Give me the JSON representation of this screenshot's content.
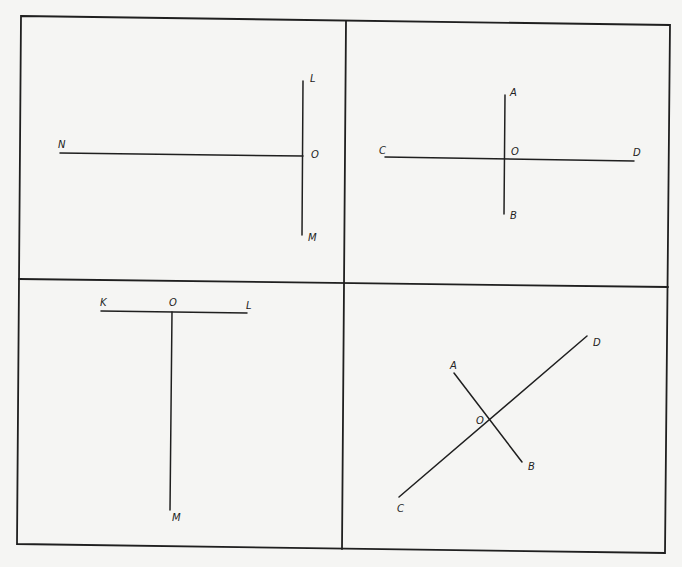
{
  "figure": {
    "background": "#f5f5f3",
    "ink": "#1f1f1f",
    "frame": {
      "corners": [
        [
          21,
          16
        ],
        [
          670,
          25
        ],
        [
          665,
          553
        ],
        [
          17,
          544
        ]
      ]
    },
    "dividers": {
      "vertical": [
        [
          346,
          21
        ],
        [
          342,
          549
        ]
      ],
      "horizontal": [
        [
          19,
          279
        ],
        [
          668,
          287
        ]
      ]
    },
    "panels": [
      {
        "id": "panel-1",
        "description": "Line NO meeting line LM at point O (perpendicular, T-shape rotated)",
        "segments": [
          {
            "name": "segment-NO",
            "from": [
              60,
              153
            ],
            "to": [
              303,
              156
            ]
          },
          {
            "name": "segment-LM",
            "from": [
              303,
              81
            ],
            "to": [
              302,
              235
            ]
          }
        ],
        "labels": [
          {
            "text": "N",
            "x": 58,
            "y": 148
          },
          {
            "text": "L",
            "x": 310,
            "y": 82
          },
          {
            "text": "O",
            "x": 311,
            "y": 158
          },
          {
            "text": "M",
            "x": 308,
            "y": 241
          }
        ]
      },
      {
        "id": "panel-2",
        "description": "Lines AB and CD intersecting perpendicularly at O",
        "segments": [
          {
            "name": "segment-AB",
            "from": [
              505,
              95
            ],
            "to": [
              504,
              214
            ]
          },
          {
            "name": "segment-CD",
            "from": [
              385,
              157
            ],
            "to": [
              634,
              161
            ]
          }
        ],
        "labels": [
          {
            "text": "A",
            "x": 510,
            "y": 96
          },
          {
            "text": "C",
            "x": 379,
            "y": 154
          },
          {
            "text": "O",
            "x": 511,
            "y": 155
          },
          {
            "text": "D",
            "x": 633,
            "y": 156
          },
          {
            "text": "B",
            "x": 510,
            "y": 219
          }
        ]
      },
      {
        "id": "panel-3",
        "description": "Line OM perpendicular to line KL at O (T-shape)",
        "segments": [
          {
            "name": "segment-KL",
            "from": [
              101,
              311
            ],
            "to": [
              247,
              313
            ]
          },
          {
            "name": "segment-OM",
            "from": [
              172,
              312
            ],
            "to": [
              170,
              510
            ]
          }
        ],
        "labels": [
          {
            "text": "K",
            "x": 100,
            "y": 306
          },
          {
            "text": "O",
            "x": 169,
            "y": 306
          },
          {
            "text": "L",
            "x": 246,
            "y": 309
          },
          {
            "text": "M",
            "x": 172,
            "y": 521
          }
        ]
      },
      {
        "id": "panel-4",
        "description": "Oblique lines AB and CD intersecting perpendicularly at O",
        "segments": [
          {
            "name": "segment-CD",
            "from": [
              399,
              497
            ],
            "to": [
              587,
              336
            ]
          },
          {
            "name": "segment-AB",
            "from": [
              454,
              373
            ],
            "to": [
              522,
              462
            ]
          }
        ],
        "labels": [
          {
            "text": "D",
            "x": 593,
            "y": 346
          },
          {
            "text": "A",
            "x": 450,
            "y": 369
          },
          {
            "text": "O",
            "x": 476,
            "y": 424
          },
          {
            "text": "B",
            "x": 528,
            "y": 470
          },
          {
            "text": "C",
            "x": 397,
            "y": 512
          }
        ]
      }
    ]
  }
}
